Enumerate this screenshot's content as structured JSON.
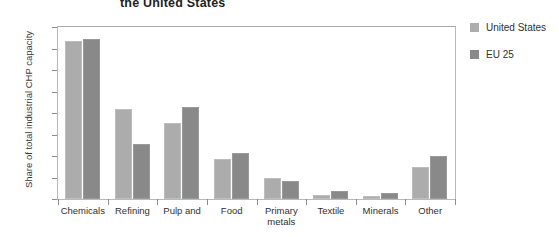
{
  "chart_data": {
    "type": "bar",
    "title": "the United States",
    "xlabel": "",
    "ylabel": "Share of total industrial CHP capacity",
    "ylim": [
      0,
      40
    ],
    "ytick_labels": [
      "40%",
      "35%",
      "30%",
      "25%",
      "20%",
      "15%",
      "10%",
      "5%",
      "0%"
    ],
    "ytick_values": [
      40,
      35,
      30,
      25,
      20,
      15,
      10,
      5,
      0
    ],
    "grid": false,
    "legend_position": "right",
    "categories": [
      "Chemicals",
      "Refining",
      "Pulp and",
      "Food",
      "Primary metals",
      "Textile",
      "Minerals",
      "Other"
    ],
    "series": [
      {
        "name": "United States",
        "color": "#acacac",
        "values": [
          36.7,
          21.0,
          17.7,
          9.3,
          5.0,
          1.0,
          0.8,
          7.5
        ]
      },
      {
        "name": "EU 25",
        "color": "#898989",
        "values": [
          37.2,
          12.7,
          21.4,
          10.7,
          4.2,
          1.8,
          1.3,
          10.0
        ]
      }
    ]
  }
}
